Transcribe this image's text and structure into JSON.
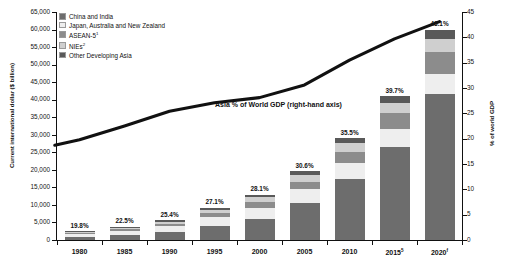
{
  "chart_data": {
    "type": "bar",
    "title": "",
    "subtitle": "",
    "categories": [
      "1980",
      "1985",
      "1990",
      "1995",
      "2000",
      "2005",
      "2010",
      "2015",
      "2020"
    ],
    "category_superscripts": [
      "",
      "",
      "",
      "",
      "",
      "",
      "",
      "5",
      "f"
    ],
    "ylabel": "Current international dollar ($ billion)",
    "ylabel_right": "% of world GDP",
    "xlabel": "",
    "ylim": [
      0,
      65000
    ],
    "ylim_right": [
      0,
      45
    ],
    "yticks": [
      "0",
      "5,000",
      "10,000",
      "15,000",
      "20,000",
      "25,000",
      "30,000",
      "35,000",
      "40,000",
      "45,000",
      "50,000",
      "55,000",
      "60,000",
      "65,000"
    ],
    "ytick_values": [
      0,
      5000,
      10000,
      15000,
      20000,
      25000,
      30000,
      35000,
      40000,
      45000,
      50000,
      55000,
      60000,
      65000
    ],
    "yticks_right": [
      "0",
      "5",
      "10",
      "15",
      "20",
      "25",
      "30",
      "35",
      "40",
      "45"
    ],
    "ytick_values_right": [
      0,
      5,
      10,
      15,
      20,
      25,
      30,
      35,
      40,
      45
    ],
    "grid": false,
    "legend_position": "top-left",
    "stacked": true,
    "series": [
      {
        "name": "China and India",
        "color": "#6d6d6d",
        "values": [
          900,
          1450,
          2250,
          4050,
          6100,
          10500,
          17500,
          26500,
          41500
        ]
      },
      {
        "name": "Japan, Australia and New Zealand",
        "color": "#eeeeee",
        "values": [
          850,
          1200,
          1700,
          2450,
          3150,
          3900,
          4500,
          5200,
          5900
        ]
      },
      {
        "name": "ASEAN-5",
        "color": "#8c8c8c",
        "values": [
          330,
          470,
          700,
          1150,
          1550,
          2250,
          3150,
          4400,
          6100
        ]
      },
      {
        "name": "NIEs",
        "color": "#cfcfcf",
        "values": [
          260,
          400,
          620,
          1000,
          1400,
          1900,
          2450,
          3050,
          3900
        ]
      },
      {
        "name": "Other Developing Asia",
        "color": "#595959",
        "values": [
          160,
          230,
          330,
          520,
          700,
          1000,
          1400,
          1850,
          2600
        ]
      }
    ],
    "bar_labels": [
      "19.8%",
      "22.5%",
      "25.4%",
      "27.1%",
      "28.1%",
      "30.6%",
      "35.5%",
      "39.7%",
      "43.1%"
    ],
    "line_series": {
      "name": "Asia % of World GDP (right-hand axis)",
      "annotation": "Asia % of World GDP (right-hand axis)",
      "color": "#111111",
      "axis": "right",
      "values": [
        19.8,
        22.5,
        25.4,
        27.1,
        28.1,
        30.6,
        35.5,
        39.7,
        43.1
      ]
    },
    "legend": [
      {
        "label": "China and India",
        "superscript": "",
        "color": "#6d6d6d"
      },
      {
        "label": "Japan, Australia and New Zealand",
        "superscript": "",
        "color": "#eeeeee"
      },
      {
        "label": "ASEAN-5",
        "superscript": "1",
        "color": "#8c8c8c"
      },
      {
        "label": "NIEs",
        "superscript": "2",
        "color": "#cfcfcf"
      },
      {
        "label": "Other Developing Asia",
        "superscript": "",
        "color": "#595959"
      }
    ]
  }
}
